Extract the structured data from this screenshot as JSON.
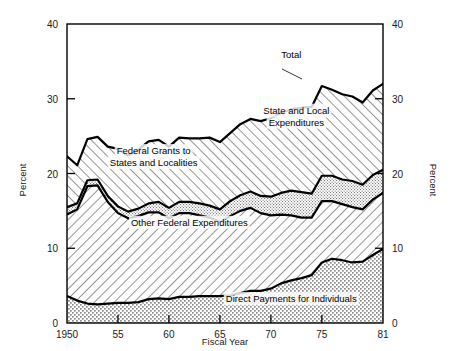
{
  "chart_data": {
    "type": "area",
    "title": "",
    "xlabel": "Fiscal Year",
    "ylabel": "Percent",
    "ylabel_right": "Percent",
    "xlim": [
      1950,
      1981
    ],
    "ylim": [
      0,
      40
    ],
    "yticks": [
      0,
      10,
      20,
      30,
      40
    ],
    "ytick_labels": [
      "0",
      "10",
      "20",
      "30",
      "40"
    ],
    "xticks": [
      1950,
      1955,
      1960,
      1965,
      1970,
      1975,
      1981
    ],
    "xtick_labels": [
      "1950",
      "55",
      "60",
      "65",
      "70",
      "75",
      "81"
    ],
    "grid": false,
    "legend_position": "inline-annotations",
    "stacked": true,
    "annotations": [
      {
        "text": "Total",
        "x": 1972,
        "y": 35.5
      },
      {
        "text": "State and Local",
        "x": 1972.5,
        "y": 28.0
      },
      {
        "text": "Expenditures",
        "x": 1972.5,
        "y": 26.4
      },
      {
        "text": "Federal Grants to",
        "x": 1958.5,
        "y": 22.6
      },
      {
        "text": "States and Localities",
        "x": 1958.5,
        "y": 21.0
      },
      {
        "text": "Other Federal Expenditures",
        "x": 1962,
        "y": 13.0
      },
      {
        "text": "Direct Payments for Individuals",
        "x": 1972,
        "y": 2.8
      }
    ],
    "x": [
      1950,
      1951,
      1952,
      1953,
      1954,
      1955,
      1956,
      1957,
      1958,
      1959,
      1960,
      1961,
      1962,
      1963,
      1964,
      1965,
      1966,
      1967,
      1968,
      1969,
      1970,
      1971,
      1972,
      1973,
      1974,
      1975,
      1976,
      1977,
      1978,
      1979,
      1980,
      1981
    ],
    "series": [
      {
        "name": "Direct Payments for Individuals",
        "fill": "stipple-coarse",
        "values": [
          3.6,
          3.0,
          2.6,
          2.5,
          2.6,
          2.7,
          2.7,
          2.8,
          3.2,
          3.3,
          3.2,
          3.5,
          3.5,
          3.6,
          3.6,
          3.6,
          3.7,
          4.0,
          4.3,
          4.3,
          4.6,
          5.3,
          5.7,
          6.0,
          6.4,
          8.1,
          8.6,
          8.4,
          8.1,
          8.2,
          9.1,
          9.9
        ]
      },
      {
        "name": "Other Federal Expenditures",
        "fill": "hatch-left",
        "values": [
          10.9,
          12.2,
          15.7,
          15.9,
          13.6,
          12.0,
          11.3,
          11.5,
          11.6,
          11.5,
          10.8,
          11.2,
          11.2,
          10.8,
          10.5,
          9.9,
          10.6,
          11.0,
          11.1,
          10.4,
          9.8,
          9.2,
          8.7,
          8.1,
          7.7,
          8.2,
          7.7,
          7.5,
          7.4,
          7.0,
          7.4,
          7.5
        ]
      },
      {
        "name": "Federal Grants to States and Localities",
        "fill": "stipple-fine",
        "values": [
          1.0,
          0.8,
          0.8,
          0.8,
          0.8,
          0.9,
          0.9,
          1.0,
          1.2,
          1.4,
          1.4,
          1.5,
          1.5,
          1.6,
          1.6,
          1.7,
          2.0,
          2.1,
          2.2,
          2.3,
          2.5,
          2.9,
          3.3,
          3.4,
          3.2,
          3.4,
          3.4,
          3.3,
          3.5,
          3.3,
          3.3,
          3.1
        ]
      },
      {
        "name": "State and Local Expenditures",
        "fill": "hatch-right",
        "values": [
          6.8,
          5.1,
          5.5,
          5.7,
          6.6,
          7.7,
          7.5,
          7.9,
          8.3,
          8.3,
          8.2,
          8.6,
          8.5,
          8.7,
          9.1,
          9.0,
          9.1,
          9.5,
          9.7,
          10.0,
          10.5,
          10.7,
          10.9,
          11.3,
          11.6,
          12.0,
          11.5,
          11.4,
          11.3,
          11.0,
          11.3,
          11.5
        ]
      }
    ],
    "total_label": "Total",
    "totals": [
      22.3,
      21.1,
      24.6,
      24.9,
      23.6,
      23.3,
      22.4,
      23.2,
      24.3,
      24.5,
      23.6,
      24.8,
      24.7,
      24.7,
      24.8,
      24.2,
      25.4,
      26.6,
      27.3,
      27.0,
      27.4,
      28.1,
      28.6,
      28.8,
      28.9,
      31.7,
      31.2,
      30.6,
      30.3,
      29.5,
      31.1,
      32.0
    ]
  }
}
